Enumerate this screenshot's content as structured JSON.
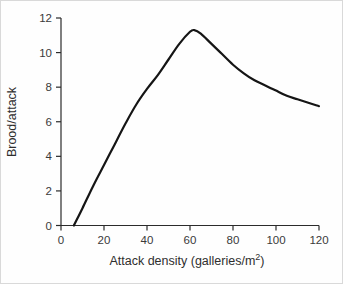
{
  "colors": {
    "curve": "#151515",
    "axis": "#2b2b2b",
    "tick_text": "#3a3a3a",
    "background": "#fefefe",
    "frame_border": "#d9d9d9"
  },
  "chart_data": {
    "type": "line",
    "title": "",
    "xlabel": "Attack density (galleries/m²)",
    "xlabel_parts": {
      "main": "Attack density (galleries/m",
      "sup": "2",
      "end": ")"
    },
    "ylabel": "Brood/attack",
    "xlim": [
      0,
      120
    ],
    "ylim": [
      0,
      12
    ],
    "xticks": [
      0,
      20,
      40,
      60,
      80,
      100,
      120
    ],
    "yticks": [
      0,
      2,
      4,
      6,
      8,
      10,
      12
    ],
    "grid": false,
    "legend": null,
    "series": [
      {
        "name": "brood-per-attack-curve",
        "points": [
          [
            6,
            0
          ],
          [
            10,
            1.0
          ],
          [
            15,
            2.3
          ],
          [
            20,
            3.5
          ],
          [
            25,
            4.7
          ],
          [
            30,
            5.9
          ],
          [
            35,
            7.0
          ],
          [
            40,
            7.9
          ],
          [
            45,
            8.7
          ],
          [
            50,
            9.6
          ],
          [
            55,
            10.5
          ],
          [
            60,
            11.2
          ],
          [
            62,
            11.3
          ],
          [
            65,
            11.1
          ],
          [
            70,
            10.5
          ],
          [
            75,
            9.9
          ],
          [
            80,
            9.3
          ],
          [
            85,
            8.8
          ],
          [
            90,
            8.4
          ],
          [
            95,
            8.1
          ],
          [
            100,
            7.8
          ],
          [
            105,
            7.5
          ],
          [
            110,
            7.3
          ],
          [
            115,
            7.1
          ],
          [
            120,
            6.9
          ]
        ]
      }
    ]
  }
}
